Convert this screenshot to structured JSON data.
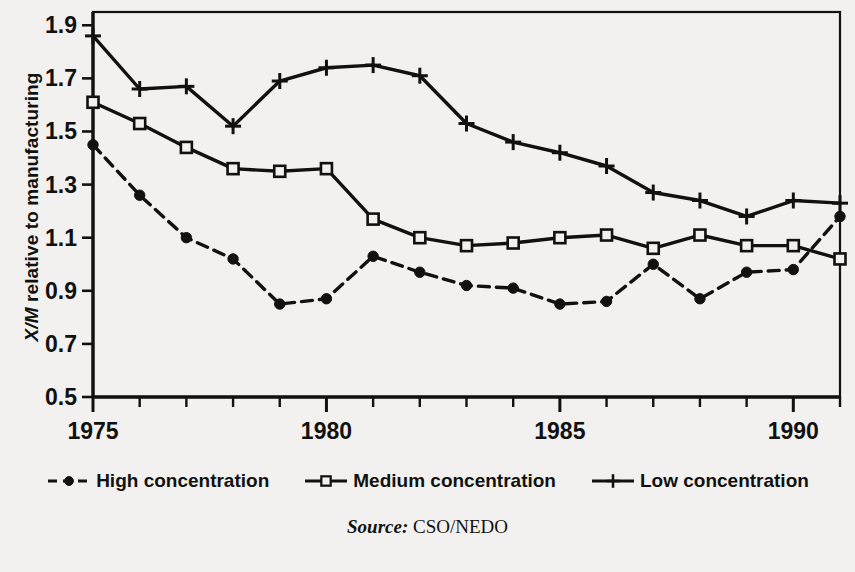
{
  "figure": {
    "background_color": "#f2f1ef",
    "ink_color": "#111111",
    "ylabel_prefix": "X/M",
    "ylabel_rest": " relative to manufacturing",
    "source_word": "Source:",
    "source_value": "CSO/NEDO"
  },
  "legend": {
    "items": [
      {
        "label": "High concentration",
        "marker": "filled-circle-icon",
        "line": "dashed"
      },
      {
        "label": "Medium concentration",
        "marker": "open-square-icon",
        "line": "solid"
      },
      {
        "label": "Low concentration",
        "marker": "plus-icon",
        "line": "solid"
      }
    ]
  },
  "chart_data": {
    "type": "line",
    "title": "",
    "xlabel": "",
    "ylabel": "X/M relative to manufacturing",
    "xlim": [
      1975,
      1991
    ],
    "ylim": [
      0.5,
      1.95
    ],
    "yticks": [
      0.5,
      0.7,
      0.9,
      1.1,
      1.3,
      1.5,
      1.7,
      1.9
    ],
    "ytick_labels": [
      "0.5",
      "0.7",
      "0.9",
      "1.1",
      "1.3",
      "1.5",
      "1.7",
      "1.9"
    ],
    "xticks": [
      1975,
      1976,
      1977,
      1978,
      1979,
      1980,
      1981,
      1982,
      1983,
      1984,
      1985,
      1986,
      1987,
      1988,
      1989,
      1990,
      1991
    ],
    "xtick_labels_shown": [
      "1975",
      "1980",
      "1985",
      "1990"
    ],
    "xtick_labels_shown_at": [
      1975,
      1980,
      1985,
      1990
    ],
    "grid": false,
    "legend_position": "below",
    "x": [
      1975,
      1976,
      1977,
      1978,
      1979,
      1980,
      1981,
      1982,
      1983,
      1984,
      1985,
      1986,
      1987,
      1988,
      1989,
      1990,
      1991
    ],
    "series": [
      {
        "name": "High concentration",
        "marker": "filled-circle-icon",
        "line_style": "dashed",
        "values": [
          1.45,
          1.26,
          1.1,
          1.02,
          0.85,
          0.87,
          1.03,
          0.97,
          0.92,
          0.91,
          0.85,
          0.86,
          1.0,
          0.87,
          0.97,
          0.98,
          1.18
        ]
      },
      {
        "name": "Medium concentration",
        "marker": "open-square-icon",
        "line_style": "solid",
        "values": [
          1.61,
          1.53,
          1.44,
          1.36,
          1.35,
          1.36,
          1.17,
          1.1,
          1.07,
          1.08,
          1.1,
          1.11,
          1.06,
          1.11,
          1.07,
          1.07,
          1.02
        ]
      },
      {
        "name": "Low concentration",
        "marker": "plus-icon",
        "line_style": "solid",
        "values": [
          1.86,
          1.66,
          1.67,
          1.52,
          1.69,
          1.74,
          1.75,
          1.71,
          1.53,
          1.46,
          1.42,
          1.37,
          1.27,
          1.24,
          1.18,
          1.24,
          1.23
        ]
      }
    ]
  }
}
